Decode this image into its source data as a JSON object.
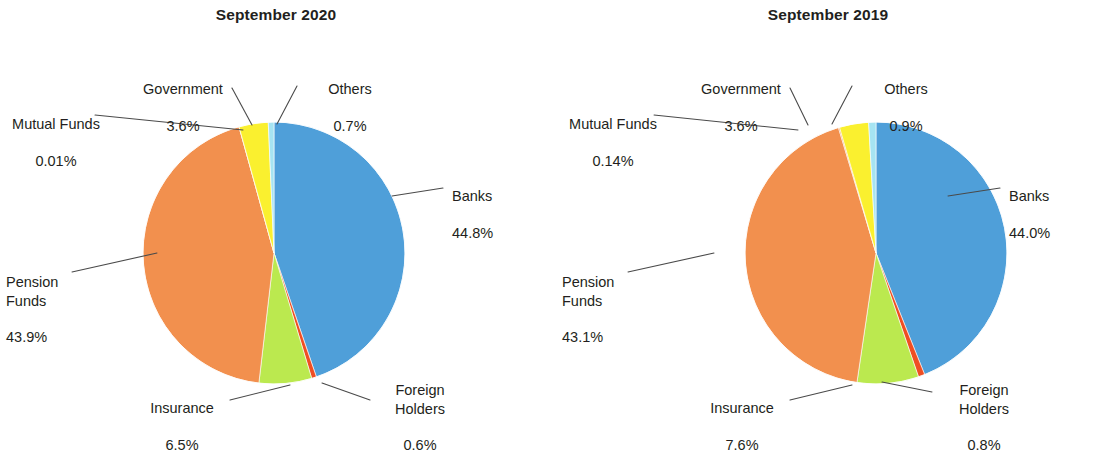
{
  "figure": {
    "background": "#ffffff",
    "panels": [
      "September 2020",
      "September 2019"
    ]
  },
  "colors": {
    "banks": "#4f9fd9",
    "pension_funds": "#f2904e",
    "insurance": "#bbe94f",
    "government": "#faf02f",
    "mutual_funds": "#f2904e",
    "others": "#a6e4f2",
    "foreign_holders": "#ef4e23",
    "text": "#231f20",
    "leader_line": "#4a4a4a"
  },
  "left": {
    "title": "September 2020",
    "labels": {
      "government": {
        "name": "Government",
        "pct": "3.6%"
      },
      "others": {
        "name": "Others",
        "pct": "0.7%"
      },
      "mutual_funds": {
        "name": "Mutual Funds",
        "pct": "0.01%"
      },
      "banks": {
        "name": "Banks",
        "pct": "44.8%"
      },
      "pension_funds": {
        "name": "Pension\nFunds",
        "pct": "43.9%"
      },
      "insurance": {
        "name": "Insurance",
        "pct": "6.5%"
      },
      "foreign_holders": {
        "name": "Foreign\nHolders",
        "pct": "0.6%"
      }
    }
  },
  "right": {
    "title": "September 2019",
    "labels": {
      "government": {
        "name": "Government",
        "pct": "3.6%"
      },
      "others": {
        "name": "Others",
        "pct": "0.9%"
      },
      "mutual_funds": {
        "name": "Mutual Funds",
        "pct": "0.14%"
      },
      "banks": {
        "name": "Banks",
        "pct": "44.0%"
      },
      "pension_funds": {
        "name": "Pension\nFunds",
        "pct": "43.1%"
      },
      "insurance": {
        "name": "Insurance",
        "pct": "7.6%"
      },
      "foreign_holders": {
        "name": "Foreign\nHolders",
        "pct": "0.8%"
      }
    }
  },
  "chart_data": [
    {
      "type": "pie",
      "title": "September 2020",
      "unit": "percent",
      "start_angle_deg": 0,
      "direction": "clockwise",
      "categories": [
        "Banks",
        "Foreign Holders",
        "Insurance",
        "Pension Funds",
        "Mutual Funds",
        "Government",
        "Others"
      ],
      "values": [
        44.8,
        0.6,
        6.5,
        43.9,
        0.01,
        3.6,
        0.7
      ],
      "colors": [
        "#4f9fd9",
        "#ef4e23",
        "#bbe94f",
        "#f2904e",
        "#f2904e",
        "#faf02f",
        "#a6e4f2"
      ],
      "labels": [
        "44.8%",
        "0.6%",
        "6.5%",
        "43.9%",
        "0.01%",
        "3.6%",
        "0.7%"
      ],
      "legend": "callout-labels-with-leader-lines",
      "grid": false
    },
    {
      "type": "pie",
      "title": "September 2019",
      "unit": "percent",
      "start_angle_deg": 0,
      "direction": "clockwise",
      "categories": [
        "Banks",
        "Foreign Holders",
        "Insurance",
        "Pension Funds",
        "Mutual Funds",
        "Government",
        "Others"
      ],
      "values": [
        44.0,
        0.8,
        7.6,
        43.1,
        0.14,
        3.6,
        0.9
      ],
      "colors": [
        "#4f9fd9",
        "#ef4e23",
        "#bbe94f",
        "#f2904e",
        "#f2904e",
        "#faf02f",
        "#a6e4f2"
      ],
      "labels": [
        "44.0%",
        "0.8%",
        "7.6%",
        "43.1%",
        "0.14%",
        "3.6%",
        "0.9%"
      ],
      "legend": "callout-labels-with-leader-lines",
      "grid": false
    }
  ]
}
